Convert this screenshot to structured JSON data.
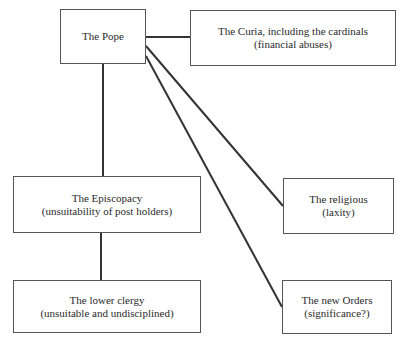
{
  "diagram": {
    "nodes": {
      "pope": {
        "title": "The Pope",
        "subtitle": ""
      },
      "curia": {
        "title": "The Curia, including the cardinals",
        "subtitle": "(financial abuses)"
      },
      "episcopacy": {
        "title": "The Episcopacy",
        "subtitle": "(unsuitability of post holders)"
      },
      "religious": {
        "title": "The religious",
        "subtitle": "(laxity)"
      },
      "lower_clergy": {
        "title": "The lower clergy",
        "subtitle": "(unsuitable and undisciplined)"
      },
      "new_orders": {
        "title": "The new Orders",
        "subtitle": "(significance?)"
      }
    },
    "edges": [
      {
        "from": "pope",
        "to": "curia"
      },
      {
        "from": "pope",
        "to": "episcopacy"
      },
      {
        "from": "pope",
        "to": "religious"
      },
      {
        "from": "pope",
        "to": "new_orders"
      },
      {
        "from": "episcopacy",
        "to": "lower_clergy"
      }
    ]
  }
}
